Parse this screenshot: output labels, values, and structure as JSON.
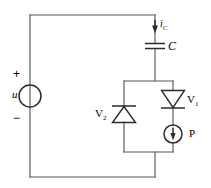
{
  "diagram": {
    "type": "electrical-schematic",
    "canvas": {
      "width": 211,
      "height": 188,
      "background": "#ffffff"
    },
    "colors": {
      "wire": "#555a5e",
      "component": "#2b2b2b",
      "label": "#1d1d1d",
      "background": "#ffffff"
    },
    "labels": {
      "source_voltage": "u",
      "source_plus": "+",
      "source_minus": "−",
      "capacitor_current": "i",
      "capacitor_current_sub": "C",
      "capacitor": "C",
      "diode_v1": "V",
      "diode_v1_sub": "1",
      "diode_v2": "V",
      "diode_v2_sub": "2",
      "current_source_p": "P"
    },
    "components": [
      {
        "name": "voltage-source-u",
        "symbol": "circle-source",
        "label": "u",
        "polarity_top": "+",
        "polarity_bottom": "−",
        "cx": 30,
        "cy": 96,
        "r": 11
      },
      {
        "name": "capacitor-c",
        "symbol": "capacitor",
        "label": "C",
        "x": 155,
        "y": 46
      },
      {
        "name": "current-arrow-ic",
        "symbol": "current-arrow-down",
        "label": "i_C",
        "x": 155,
        "y": 26
      },
      {
        "name": "diode-v2",
        "symbol": "diode-up",
        "label": "V2",
        "x": 124,
        "y": 114
      },
      {
        "name": "diode-v1",
        "symbol": "diode-down",
        "label": "V1",
        "x": 173,
        "y": 99
      },
      {
        "name": "current-source-p",
        "symbol": "circle-current-source-down",
        "label": "P",
        "cx": 173,
        "cy": 134,
        "r": 9
      }
    ],
    "nodes": {
      "outer_left_x": 30,
      "outer_top_y": 15,
      "outer_bottom_y": 177,
      "branch_x": 155,
      "inner_box": {
        "left": 124,
        "right": 173,
        "top": 81,
        "bottom": 152
      }
    }
  }
}
